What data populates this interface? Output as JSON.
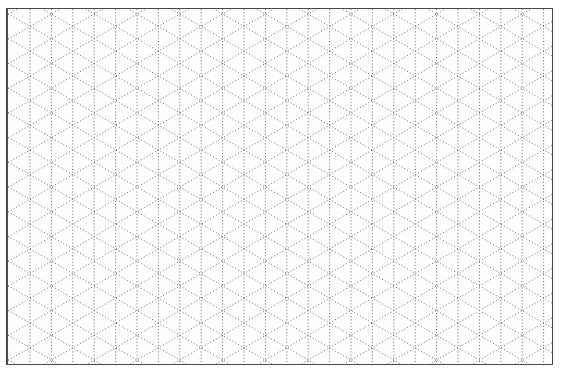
{
  "grid": {
    "type": "isometric-triangle",
    "column_spacing_px": 21.4,
    "line_style": "dotted",
    "line_color": "#6e6e6e",
    "border_color": "#4a4a4a",
    "background": "#fefefe"
  }
}
